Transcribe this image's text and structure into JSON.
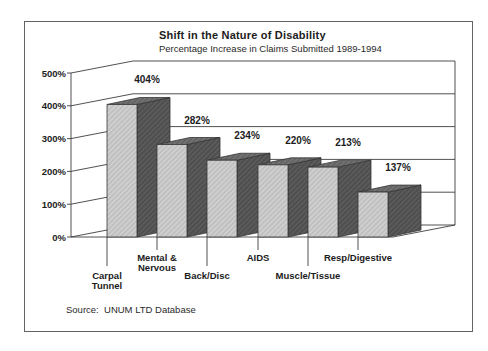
{
  "page": {
    "title": "Shift in the Nature of Disability",
    "subtitle": "Percentage Increase in Claims Submitted 1989-1994",
    "source_label": "Source:  UNUM LTD Database"
  },
  "chart_data": {
    "type": "bar",
    "projection": "3d-perspective",
    "title": "Shift in the Nature of Disability",
    "subtitle": "Percentage Increase in Claims Submitted 1989-1994",
    "source": "Source: UNUM LTD Database",
    "categories": [
      "Carpal Tunnel",
      "Mental & Nervous",
      "Back/Disc",
      "AIDS",
      "Muscle/Tissue",
      "Resp/Digestive"
    ],
    "values": [
      404,
      282,
      234,
      220,
      213,
      137
    ],
    "value_label_suffix": "%",
    "xlabel": "",
    "ylabel": "",
    "ylim": [
      0,
      500
    ],
    "ytick_step": 100,
    "ytick_labels": [
      "0%",
      "100%",
      "200%",
      "300%",
      "400%",
      "500%"
    ],
    "grid": true,
    "legend": "none",
    "category_label_lines": [
      [
        "Carpal",
        "Tunnel"
      ],
      [
        "Mental &",
        "Nervous"
      ],
      [
        "Back/Disc"
      ],
      [
        "AIDS"
      ],
      [
        "Muscle/Tissue"
      ],
      [
        "Resp/Digestive"
      ]
    ],
    "category_label_row": [
      "lower",
      "upper",
      "lower",
      "upper",
      "lower",
      "upper"
    ],
    "colors": {
      "bar_front": "#cfcfcf",
      "bar_front_stripe": "#bcbcbc",
      "bar_side": "#4e4e4e",
      "bar_side_stripe": "#5e5e5e",
      "bar_top": "#646464",
      "bar_top_stripe": "#757575",
      "axis_line": "#3d3d3d",
      "bar_edge": "#363636",
      "text": "#1c1c1c",
      "background": "#ffffff"
    }
  }
}
